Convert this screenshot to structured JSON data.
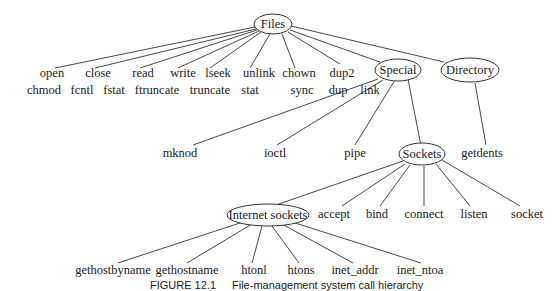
{
  "diagram": {
    "root": "Files",
    "nodes": {
      "files": "Files",
      "special": "Special",
      "directory": "Directory",
      "sockets": "Sockets",
      "internet_sockets": "Internet sockets"
    },
    "files_row1": [
      "open",
      "close",
      "read",
      "write",
      "lseek",
      "unlink",
      "chown",
      "dup2"
    ],
    "files_row2": [
      "chmod",
      "fcntl",
      "fstat",
      "ftruncate",
      "truncate",
      "stat",
      "sync",
      "dup",
      "link"
    ],
    "special_children": [
      "mknod",
      "ioctl",
      "pipe"
    ],
    "directory_children": [
      "getdents"
    ],
    "sockets_children": [
      "accept",
      "bind",
      "connect",
      "listen",
      "socket"
    ],
    "internet_children": [
      "gethostbyname",
      "gethostname",
      "htonl",
      "htons",
      "inet_addr",
      "inet_ntoa"
    ]
  },
  "caption": {
    "label": "FIGURE 12.1",
    "text": "File-management system call hierarchy"
  }
}
